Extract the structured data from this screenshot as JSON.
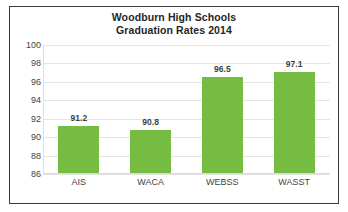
{
  "chart_data": {
    "type": "bar",
    "title": "Woodburn High Schools Graduation Rates 2014",
    "title_lines": [
      "Woodburn High Schools",
      "Graduation Rates 2014"
    ],
    "categories": [
      "AIS",
      "WACA",
      "WEBSS",
      "WASST"
    ],
    "values": [
      91.2,
      90.8,
      96.5,
      97.1
    ],
    "value_labels": [
      "91.2",
      "90.8",
      "96.5",
      "97.1"
    ],
    "xlabel": "",
    "ylabel": "",
    "ylim": [
      86,
      100
    ],
    "ytick_labels": [
      "100",
      "98",
      "96",
      "94",
      "92",
      "90",
      "88",
      "86"
    ],
    "ytick_values": [
      100,
      98,
      96,
      94,
      92,
      90,
      88,
      86
    ],
    "grid": true,
    "grid_axis": "y",
    "legend": false,
    "bar_color": "#76bc43",
    "text_color": "#3f3f3f",
    "title_color": "#262626",
    "gridline_color": "#e4e4e4",
    "border_color": "#3a3a3a",
    "background_color": "#ffffff"
  }
}
